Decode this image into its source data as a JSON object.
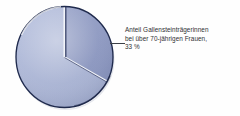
{
  "figure": {
    "background_color": "#fefefe",
    "callout": {
      "lines": [
        "Anteil Gallensteinträgerinnen",
        "bei über 70-jährigen Frauen,",
        "33 %"
      ],
      "text_color": "#2f3033",
      "leader_line_color": "#3b3f46"
    }
  },
  "chart_data": {
    "type": "pie",
    "title": "",
    "subtitle": "",
    "xlabel": "",
    "ylabel": "",
    "grid": false,
    "legend_position": "none",
    "start_angle_deg": 0,
    "direction": "clockwise",
    "labels": [
      "Anteil Gallensteinträgerinnen bei über 70-jährigen Frauen",
      "Übrige"
    ],
    "values": [
      33,
      67
    ],
    "value_unit": "%",
    "annotations": [
      "Anteil Gallensteinträgerinnen bei über 70-jährigen Frauen, 33 %"
    ],
    "colors": [
      "#8c98c1",
      "#aab5d6"
    ],
    "edge_color": "#1f2a4d",
    "separator_color": "#ffffff",
    "slices": [
      {
        "label": "Anteil Gallensteinträgerinnen bei über 70-jährigen Frauen",
        "value": 33,
        "angle_deg": 118.8,
        "color": "#8c98c1",
        "labeled": true
      },
      {
        "label": "Übrige",
        "value": 67,
        "angle_deg": 241.2,
        "color": "#aab5d6",
        "labeled": false
      }
    ]
  }
}
